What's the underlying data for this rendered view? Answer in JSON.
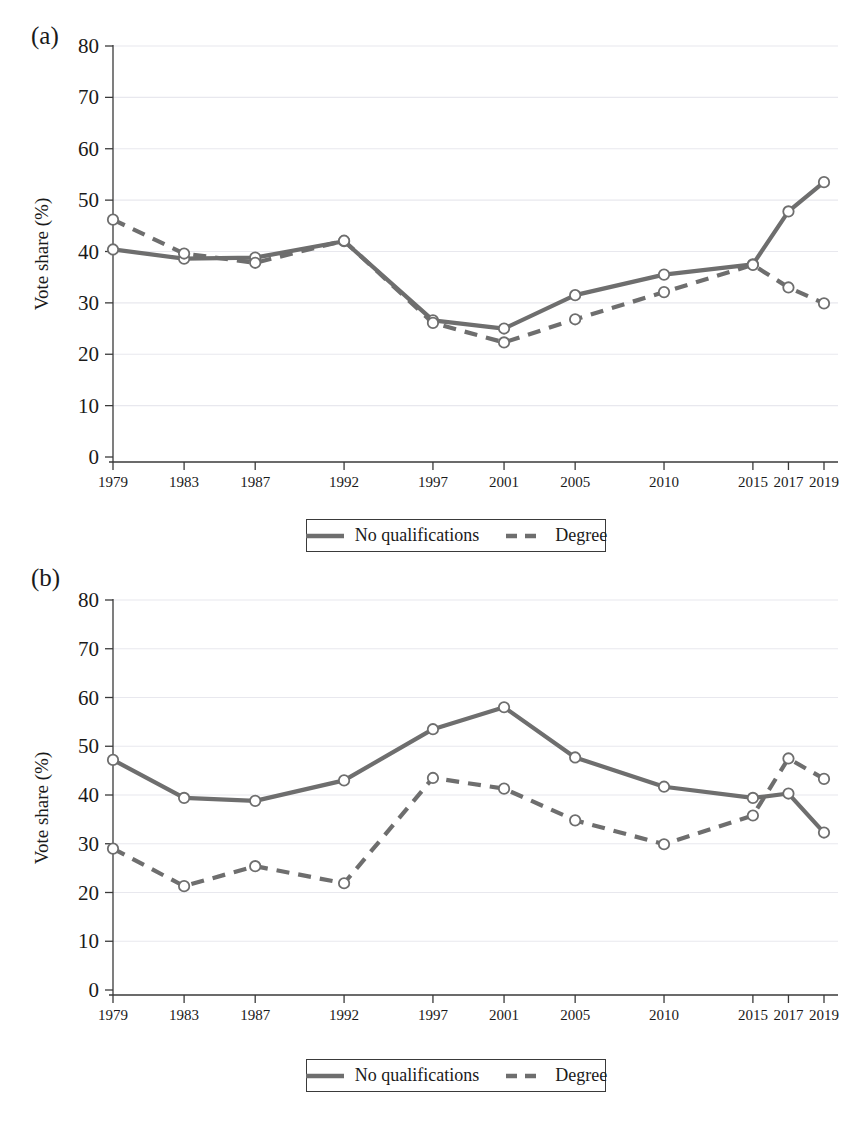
{
  "figure": {
    "panels": [
      {
        "label": "(a)",
        "ylabel": "Vote share (%)"
      },
      {
        "label": "(b)",
        "ylabel": "Vote share (%)"
      }
    ],
    "legend": {
      "entries": [
        {
          "label": "No qualifications",
          "style": "solid",
          "color": "#6e6e6e"
        },
        {
          "label": "Degree",
          "style": "dashed",
          "color": "#6e6e6e"
        }
      ]
    },
    "colors": {
      "series": "#6e6e6e",
      "axis": "#3a3a3a",
      "grid": "#e8e8ee",
      "text": "#1a1a1a"
    }
  },
  "chart_data": [
    {
      "type": "line",
      "panel": "(a)",
      "title": "",
      "xlabel": "",
      "ylabel": "Vote share (%)",
      "categories": [
        "1979",
        "1983",
        "1987",
        "1992",
        "1997",
        "2001",
        "2005",
        "2010",
        "2015",
        "2017",
        "2019"
      ],
      "x": [
        1979,
        1983,
        1987,
        1992,
        1997,
        2001,
        2005,
        2010,
        2015,
        2017,
        2019
      ],
      "xlim": [
        1979,
        2019
      ],
      "ylim": [
        0,
        80
      ],
      "yticks": [
        0,
        10,
        20,
        30,
        40,
        50,
        60,
        70,
        80
      ],
      "grid": true,
      "legend_position": "below",
      "series": [
        {
          "name": "No qualifications",
          "style": "solid",
          "values": [
            40.4,
            38.6,
            38.8,
            42.0,
            26.6,
            25.0,
            31.5,
            35.5,
            37.5,
            47.8,
            53.5
          ]
        },
        {
          "name": "Degree",
          "style": "dashed",
          "values": [
            46.2,
            39.6,
            37.8,
            42.1,
            26.1,
            22.3,
            26.8,
            32.1,
            37.4,
            33.0,
            29.9
          ]
        }
      ]
    },
    {
      "type": "line",
      "panel": "(b)",
      "title": "",
      "xlabel": "",
      "ylabel": "Vote share (%)",
      "categories": [
        "1979",
        "1983",
        "1987",
        "1992",
        "1997",
        "2001",
        "2005",
        "2010",
        "2015",
        "2017",
        "2019"
      ],
      "x": [
        1979,
        1983,
        1987,
        1992,
        1997,
        2001,
        2005,
        2010,
        2015,
        2017,
        2019
      ],
      "xlim": [
        1979,
        2019
      ],
      "ylim": [
        0,
        80
      ],
      "yticks": [
        0,
        10,
        20,
        30,
        40,
        50,
        60,
        70,
        80
      ],
      "grid": true,
      "legend_position": "below",
      "series": [
        {
          "name": "No qualifications",
          "style": "solid",
          "values": [
            47.2,
            39.4,
            38.8,
            43.0,
            53.5,
            58.0,
            47.7,
            41.7,
            39.4,
            40.3,
            32.3
          ]
        },
        {
          "name": "Degree",
          "style": "dashed",
          "values": [
            29.0,
            21.3,
            25.4,
            21.9,
            43.5,
            41.3,
            34.8,
            29.9,
            35.8,
            47.5,
            43.3
          ]
        }
      ]
    }
  ]
}
